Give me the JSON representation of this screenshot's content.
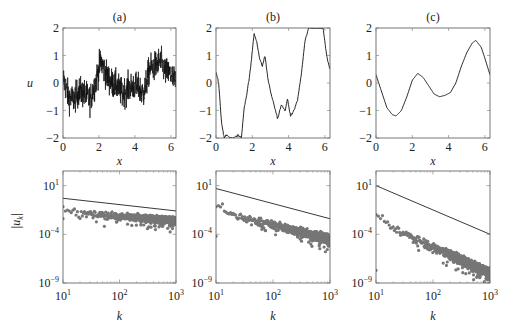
{
  "chart_data": [
    {
      "id": "a",
      "type": "line",
      "title": "(a)",
      "xlabel": "x",
      "ylabel": "u",
      "xlim": [
        0,
        6.283
      ],
      "ylim": [
        -2,
        2
      ],
      "xticks": [
        0,
        2,
        4,
        6
      ],
      "yticks": [
        -2,
        -1,
        0,
        1,
        2
      ],
      "description": "highly oscillatory rough signal, mean near 0, range approx -1.7 to 1.8",
      "x": [
        0,
        0.3,
        0.6,
        0.9,
        1.2,
        1.5,
        1.8,
        2.1,
        2.4,
        2.7,
        3.0,
        3.3,
        3.6,
        3.9,
        4.2,
        4.5,
        4.8,
        5.1,
        5.4,
        5.7,
        6.0,
        6.28
      ],
      "y": [
        0.2,
        -0.5,
        -0.6,
        -0.3,
        -0.4,
        -0.6,
        0.0,
        0.8,
        0.3,
        0.0,
        -0.1,
        -0.4,
        -0.2,
        -0.1,
        -0.2,
        -0.4,
        0.5,
        0.6,
        0.8,
        0.4,
        0.3,
        0.0
      ]
    },
    {
      "id": "b",
      "type": "line",
      "title": "(b)",
      "xlabel": "x",
      "ylabel": "",
      "xlim": [
        0,
        6.283
      ],
      "ylim": [
        -2,
        2
      ],
      "xticks": [
        0,
        2,
        4,
        6
      ],
      "yticks": [
        -2,
        -1,
        0,
        1,
        2
      ],
      "x": [
        0,
        0.15,
        0.3,
        0.45,
        0.6,
        0.8,
        1.0,
        1.2,
        1.4,
        1.55,
        1.7,
        1.9,
        2.1,
        2.25,
        2.4,
        2.55,
        2.7,
        2.85,
        3.0,
        3.2,
        3.4,
        3.6,
        3.8,
        3.95,
        4.1,
        4.3,
        4.5,
        4.7,
        4.9,
        5.1,
        5.3,
        5.6,
        5.9,
        6.1,
        6.28
      ],
      "y": [
        0.4,
        0.0,
        -1.4,
        -2.0,
        -1.9,
        -2.0,
        -2.0,
        -1.9,
        -2.0,
        -0.9,
        -0.4,
        0.5,
        1.8,
        1.5,
        0.9,
        0.6,
        1.0,
        0.2,
        -0.3,
        -0.8,
        -1.3,
        -0.8,
        -1.0,
        -0.6,
        -1.2,
        -1.0,
        -0.6,
        0.3,
        1.5,
        2.0,
        2.0,
        2.0,
        2.0,
        1.0,
        0.5
      ]
    },
    {
      "id": "c",
      "type": "line",
      "title": "(c)",
      "xlabel": "x",
      "ylabel": "",
      "xlim": [
        0,
        6.283
      ],
      "ylim": [
        -2,
        2
      ],
      "xticks": [
        0,
        2,
        4,
        6
      ],
      "yticks": [
        -2,
        -1,
        0,
        1,
        2
      ],
      "x": [
        0,
        0.3,
        0.6,
        0.9,
        1.1,
        1.4,
        1.7,
        2.0,
        2.3,
        2.6,
        2.9,
        3.2,
        3.5,
        3.8,
        4.1,
        4.4,
        4.7,
        5.0,
        5.3,
        5.5,
        5.8,
        6.0,
        6.28
      ],
      "y": [
        0.3,
        -0.3,
        -0.9,
        -1.15,
        -1.2,
        -1.0,
        -0.5,
        0.1,
        0.35,
        0.2,
        -0.1,
        -0.4,
        -0.5,
        -0.45,
        -0.35,
        0.0,
        0.6,
        1.1,
        1.45,
        1.55,
        1.3,
        0.9,
        0.3
      ]
    },
    {
      "id": "a_spec",
      "type": "scatter",
      "title": "",
      "xlabel": "k",
      "ylabel": "|u_k|",
      "xscale": "log",
      "yscale": "log",
      "xlim": [
        10,
        1000
      ],
      "ylim_exp": [
        -9,
        2.5
      ],
      "xticks": [
        "10^1",
        "10^2",
        "10^3"
      ],
      "yticks": [
        "10^-9",
        "10^-4",
        "10^1"
      ],
      "reference_line": {
        "k": [
          10,
          1000
        ],
        "log10_y": [
          -0.3,
          -1.6
        ]
      },
      "scatter_trend_log10": {
        "k_start": 10,
        "k_end": 1000,
        "center_start": -1.7,
        "center_end": -2.6,
        "spread": 0.6,
        "low_outlier": -3.6
      }
    },
    {
      "id": "b_spec",
      "type": "scatter",
      "title": "",
      "xlabel": "k",
      "ylabel": "",
      "xscale": "log",
      "yscale": "log",
      "xlim": [
        10,
        1000
      ],
      "ylim_exp": [
        -9,
        2.5
      ],
      "xticks": [
        "10^1",
        "10^2",
        "10^3"
      ],
      "yticks": [
        "10^-9",
        "10^-4",
        "10^1"
      ],
      "reference_line": {
        "k": [
          10,
          1000
        ],
        "log10_y": [
          0.7,
          -2.4
        ]
      },
      "scatter_trend_log10": {
        "k_start": 10,
        "k_end": 1000,
        "center_start": -1.6,
        "center_end": -4.5,
        "spread": 0.7,
        "low_outlier": -5.4
      }
    },
    {
      "id": "c_spec",
      "type": "scatter",
      "title": "",
      "xlabel": "k",
      "ylabel": "",
      "xscale": "log",
      "yscale": "log",
      "xlim": [
        10,
        1000
      ],
      "ylim_exp": [
        -9,
        2.5
      ],
      "xticks": [
        "10^1",
        "10^2",
        "10^3"
      ],
      "yticks": [
        "10^-9",
        "10^-4",
        "10^1"
      ],
      "reference_line": {
        "k": [
          10,
          1000
        ],
        "log10_y": [
          1.0,
          -4.0
        ]
      },
      "scatter_trend_log10": {
        "k_start": 10,
        "k_end": 1000,
        "center_start": -2.6,
        "center_end": -8.0,
        "spread": 0.8,
        "low_outlier": -8.9
      }
    }
  ],
  "labels": {
    "title_a": "(a)",
    "title_b": "(b)",
    "title_c": "(c)",
    "x": "x",
    "u": "u",
    "k": "k",
    "uk": "|u",
    "uk_sub": "k",
    "uk_end": "|"
  }
}
